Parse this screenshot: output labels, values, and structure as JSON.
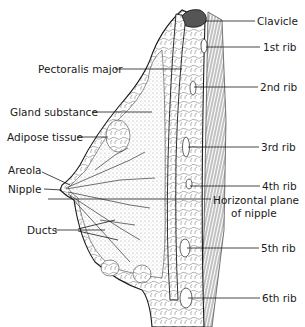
{
  "diagram": {
    "colors": {
      "ink": "#1a1a1a",
      "stipple": "#9a9a9a",
      "background": "#ffffff"
    },
    "labels_left": [
      {
        "id": "pectoralis-major",
        "text": "Pectoralis major",
        "x": 38,
        "y": 63
      },
      {
        "id": "gland-substance",
        "text": "Gland substance",
        "x": 10,
        "y": 106
      },
      {
        "id": "adipose-tissue",
        "text": "Adipose tissue",
        "x": 7,
        "y": 131
      },
      {
        "id": "areola",
        "text": "Areola",
        "x": 8,
        "y": 164
      },
      {
        "id": "nipple",
        "text": "Nipple",
        "x": 8,
        "y": 183
      },
      {
        "id": "ducts",
        "text": "Ducts",
        "x": 27,
        "y": 224
      }
    ],
    "labels_right": [
      {
        "id": "clavicle",
        "text": "Clavicle",
        "x": 257,
        "y": 15
      },
      {
        "id": "rib-1",
        "text": "1st rib",
        "x": 263,
        "y": 41
      },
      {
        "id": "rib-2",
        "text": "2nd rib",
        "x": 260,
        "y": 81
      },
      {
        "id": "rib-3",
        "text": "3rd rib",
        "x": 261,
        "y": 141
      },
      {
        "id": "rib-4",
        "text": "4th rib",
        "x": 262,
        "y": 180
      },
      {
        "id": "horizontal-plane-line1",
        "text": "Horizontal plane",
        "x": 213,
        "y": 194
      },
      {
        "id": "horizontal-plane-line2",
        "text": "of nipple",
        "x": 231,
        "y": 207
      },
      {
        "id": "rib-5",
        "text": "5th rib",
        "x": 261,
        "y": 242
      },
      {
        "id": "rib-6",
        "text": "6th rib",
        "x": 262,
        "y": 292
      }
    ]
  }
}
